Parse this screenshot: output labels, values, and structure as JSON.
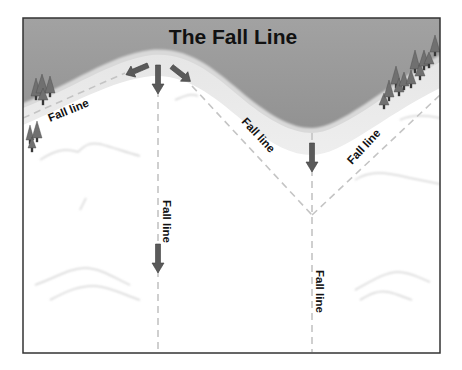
{
  "title": "The Fall Line",
  "labels": {
    "upper_left": "Fall line",
    "center_slope": "Fall line",
    "right_slope": "Fall line",
    "left_vertical": "Fall line",
    "right_vertical": "Fall line"
  },
  "colors": {
    "sky": "#8f8f8f",
    "sky_light": "#b3b3b3",
    "snow": "#ffffff",
    "arrow": "#5a5a5a",
    "trees": "#6e6e6e",
    "dashed_line": "#c4c4c4",
    "frame": "#333333",
    "text": "#111111"
  },
  "icons": {
    "arrows": [
      "arrow-down-left-icon",
      "arrow-down-icon",
      "arrow-down-right-icon",
      "arrow-down-icon",
      "arrow-down-icon"
    ],
    "trees": "pine-tree-icon"
  }
}
